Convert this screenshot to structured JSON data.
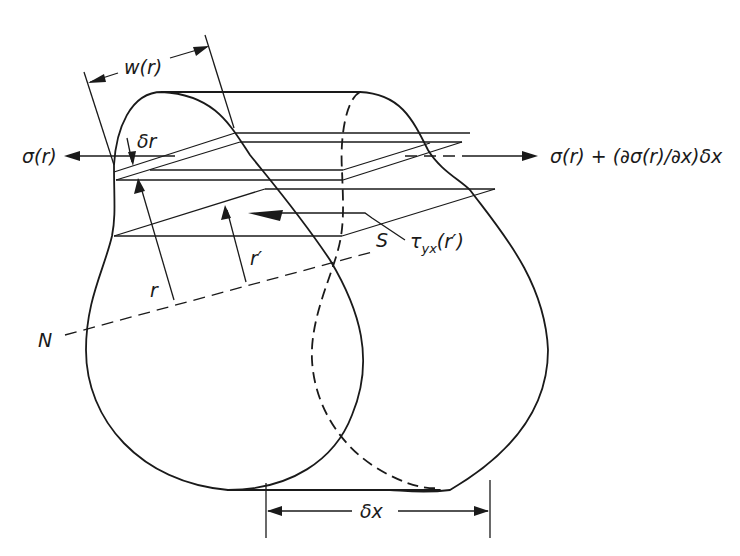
{
  "diagram": {
    "labels": {
      "width": "w(r)",
      "delta_r": "δr",
      "sigma_left": "σ(r)",
      "sigma_right": "σ(r) + (∂σ(r)/∂x)δx",
      "r": "r",
      "r_prime": "r′",
      "S": "S",
      "N": "N",
      "tau_main": "τ",
      "tau_sub": "yx",
      "tau_arg": "(r′)",
      "delta_x": "δx"
    },
    "colors": {
      "line": "#1a1a1a",
      "background": "#ffffff"
    }
  }
}
